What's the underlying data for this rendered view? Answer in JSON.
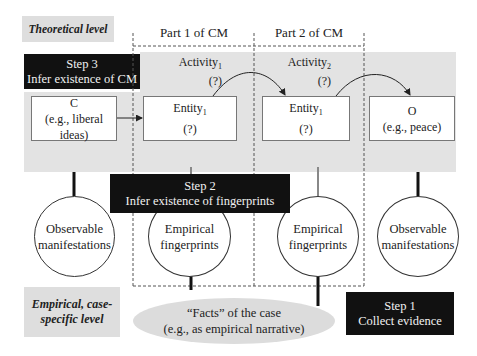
{
  "diagram": {
    "levels": {
      "theoretical": "Theoretical level",
      "empirical_line1": "Empirical, case-",
      "empirical_line2": "specific level"
    },
    "parts": [
      {
        "label": "Part 1 of CM"
      },
      {
        "label": "Part 2 of CM"
      }
    ],
    "steps": {
      "step3": {
        "title": "Step 3",
        "text": "Infer existence of CM"
      },
      "step2": {
        "title": "Step 2",
        "text": "Infer existence of fingerprints"
      },
      "step1": {
        "title": "Step 1",
        "text": "Collect evidence"
      }
    },
    "activities": [
      {
        "name": "Activity",
        "sub": "1",
        "q": "(?)"
      },
      {
        "name": "Activity",
        "sub": "2",
        "q": "(?)"
      }
    ],
    "boxes": {
      "cause": {
        "title": "C",
        "example": "(e.g., liberal ideas)"
      },
      "entity1": {
        "name": "Entity",
        "sub": "1",
        "q": "(?)"
      },
      "entity2": {
        "name": "Entity",
        "sub": "1",
        "q": "(?)"
      },
      "outcome": {
        "title": "O",
        "example": "(e.g., peace)"
      }
    },
    "circles": {
      "left": {
        "line1": "Observable",
        "line2": "manifestations"
      },
      "fp1": {
        "line1": "Empirical",
        "line2": "fingerprints"
      },
      "fp2": {
        "line1": "Empirical",
        "line2": "fingerprints"
      },
      "right": {
        "line1": "Observable",
        "line2": "manifestations"
      }
    },
    "facts": {
      "line1": "“Facts” of the case",
      "line2": "(e.g., as empirical narrative)"
    },
    "colors": {
      "band": "#e3e3e3",
      "black_box": "#111111",
      "ellipse": "#dcdcdc"
    }
  }
}
